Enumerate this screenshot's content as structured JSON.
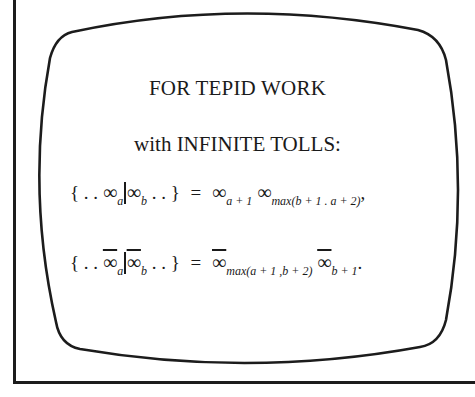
{
  "heading": {
    "line1": "FOR TEPID WORK",
    "line2": "with INFINITE TOLLS:"
  },
  "equations": [
    {
      "lhs_open": "{ . .",
      "left_symbol": "∞",
      "left_sub": "a",
      "right_symbol": "∞",
      "right_sub": "b",
      "lhs_close": ". . }",
      "equals": "=",
      "rhs_symbol_1": "∞",
      "rhs_sub_1": "a + 1",
      "rhs_symbol_2": "∞",
      "rhs_sub_2": "max(b + 1 . a + 2)",
      "terminator": ",",
      "overlined": false
    },
    {
      "lhs_open": "{ . .",
      "left_symbol": "∞",
      "left_sub": "a",
      "right_symbol": "∞",
      "right_sub": "b",
      "lhs_close": ". . }",
      "equals": "=",
      "rhs_symbol_1": "∞",
      "rhs_sub_1": "max(a + 1 ,b + 2)",
      "rhs_symbol_2": "∞",
      "rhs_sub_2": "b + 1",
      "terminator": ".",
      "overlined": true
    }
  ],
  "colors": {
    "ink": "#1a1a1a",
    "paper": "#ffffff"
  }
}
